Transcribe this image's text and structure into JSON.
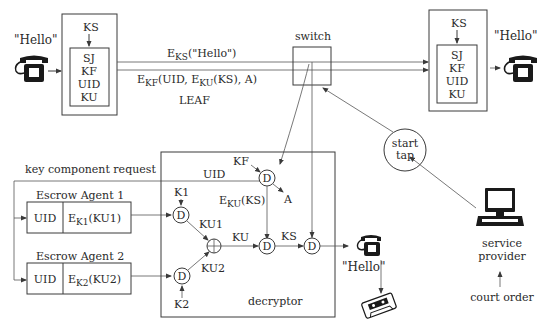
{
  "diagram": {
    "left_phone": {
      "speech": "\"Hello\""
    },
    "left_device": {
      "input_key": "KS",
      "fields": [
        "SJ",
        "KF",
        "UID",
        "KU"
      ]
    },
    "right_device": {
      "input_key": "KS",
      "fields": [
        "SJ",
        "KF",
        "UID",
        "KU"
      ]
    },
    "right_phone": {
      "speech": "\"Hello\""
    },
    "channel": {
      "top_label_main": "E",
      "top_label_sub": "KS",
      "top_label_rest": "(\"Hello\")",
      "bottom_label_main": "E",
      "bottom_label_sub": "KF",
      "bottom_label_mid": "(UID, E",
      "bottom_label_sub2": "KU",
      "bottom_label_rest": "(KS), A)",
      "leaf_label": "LEAF"
    },
    "switch": {
      "label": "switch"
    },
    "start_tap": {
      "line1": "start",
      "line2": "tap"
    },
    "service_provider": {
      "line1": "service",
      "line2": "provider"
    },
    "court_order": {
      "label": "court order"
    },
    "key_request": {
      "label": "key component request"
    },
    "escrow_agents": [
      {
        "title": "Escrow Agent 1",
        "uid": "UID",
        "enc_main": "E",
        "enc_sub": "K1",
        "enc_rest": "(KU1)"
      },
      {
        "title": "Escrow Agent 2",
        "uid": "UID",
        "enc_main": "E",
        "enc_sub": "K2",
        "enc_rest": "(KU2)"
      }
    ],
    "decryptor": {
      "label": "decryptor",
      "node_label": "D",
      "kf": "KF",
      "uid": "UID",
      "a": "A",
      "eku_main": "E",
      "eku_sub": "KU",
      "eku_rest": "(KS)",
      "k1": "K1",
      "k2": "K2",
      "ku1": "KU1",
      "ku2": "KU2",
      "ku": "KU",
      "ks": "KS"
    },
    "output_phone": {
      "speech": "\"Hello\""
    }
  }
}
